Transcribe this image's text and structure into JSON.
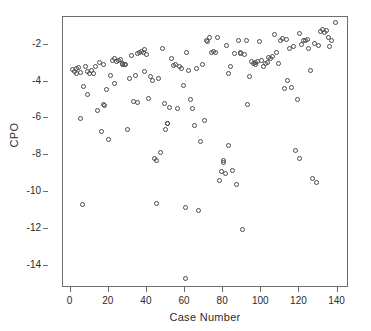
{
  "chart_data": {
    "type": "scatter",
    "title": "",
    "xlabel": "Case Number",
    "ylabel": "CPO",
    "xlim": [
      -4,
      146
    ],
    "ylim": [
      -15.2,
      -0.5
    ],
    "xticks": [
      0,
      20,
      40,
      60,
      80,
      100,
      120,
      140
    ],
    "yticks": [
      -2,
      -4,
      -6,
      -8,
      -10,
      -12,
      -14
    ],
    "xtick_labels": [
      "0",
      "20",
      "40",
      "60",
      "80",
      "100",
      "120",
      "140"
    ],
    "ytick_labels": [
      "-2",
      "-4",
      "-6",
      "-8",
      "-10",
      "-12",
      "-14"
    ],
    "grid": false,
    "legend": null,
    "marker": "open-circle",
    "marker_color": "#4a4a4d",
    "frame_color": "#6e6e70",
    "background": "#ffffff",
    "series": [
      {
        "name": "CPO",
        "points": [
          [
            1,
            -3.35
          ],
          [
            2,
            -3.45
          ],
          [
            3,
            -3.3
          ],
          [
            3,
            -3.55
          ],
          [
            4,
            -3.25
          ],
          [
            5,
            -3.5
          ],
          [
            5,
            -6.0
          ],
          [
            6,
            -10.65
          ],
          [
            7,
            -4.25
          ],
          [
            8,
            -3.2
          ],
          [
            9,
            -3.45
          ],
          [
            9,
            -4.7
          ],
          [
            10,
            -3.55
          ],
          [
            11,
            -3.4
          ],
          [
            12,
            -3.55
          ],
          [
            13,
            -3.2
          ],
          [
            14,
            -5.55
          ],
          [
            15,
            -2.95
          ],
          [
            16,
            -6.7
          ],
          [
            17,
            -3.05
          ],
          [
            17,
            -5.25
          ],
          [
            18,
            -5.3
          ],
          [
            19,
            -4.45
          ],
          [
            20,
            -7.15
          ],
          [
            21,
            -3.65
          ],
          [
            22,
            -2.85
          ],
          [
            23,
            -2.75
          ],
          [
            23,
            -4.1
          ],
          [
            24,
            -2.9
          ],
          [
            25,
            -2.85
          ],
          [
            26,
            -2.8
          ],
          [
            27,
            -3.0
          ],
          [
            27,
            -3.05
          ],
          [
            28,
            -3.1
          ],
          [
            29,
            -3.05
          ],
          [
            30,
            -6.6
          ],
          [
            31,
            -3.85
          ],
          [
            32,
            -2.6
          ],
          [
            33,
            -5.1
          ],
          [
            34,
            -3.65
          ],
          [
            35,
            -2.5
          ],
          [
            35,
            -5.15
          ],
          [
            36,
            -2.45
          ],
          [
            37,
            -2.35
          ],
          [
            38,
            -2.45
          ],
          [
            39,
            -2.25
          ],
          [
            39,
            -3.45
          ],
          [
            40,
            -2.55
          ],
          [
            41,
            -4.9
          ],
          [
            42,
            -3.75
          ],
          [
            43,
            -3.95
          ],
          [
            44,
            -8.15
          ],
          [
            45,
            -8.3
          ],
          [
            45,
            -10.6
          ],
          [
            46,
            -3.85
          ],
          [
            47,
            -7.85
          ],
          [
            48,
            -2.2
          ],
          [
            49,
            -5.2
          ],
          [
            50,
            -6.6
          ],
          [
            51,
            -6.25
          ],
          [
            51,
            -6.3
          ],
          [
            52,
            -5.4
          ],
          [
            53,
            -2.75
          ],
          [
            54,
            -3.15
          ],
          [
            55,
            -3.1
          ],
          [
            56,
            -5.45
          ],
          [
            57,
            -3.2
          ],
          [
            58,
            -3.3
          ],
          [
            59,
            -4.2
          ],
          [
            60,
            -10.85
          ],
          [
            60,
            -14.7
          ],
          [
            61,
            -2.4
          ],
          [
            62,
            -3.4
          ],
          [
            63,
            -5.0
          ],
          [
            64,
            -5.45
          ],
          [
            65,
            -6.4
          ],
          [
            66,
            -3.3
          ],
          [
            67,
            -11.0
          ],
          [
            68,
            -7.25
          ],
          [
            69,
            -3.05
          ],
          [
            70,
            -6.1
          ],
          [
            71,
            -1.8
          ],
          [
            72,
            -1.85
          ],
          [
            73,
            -1.6
          ],
          [
            74,
            -2.4
          ],
          [
            75,
            -2.35
          ],
          [
            76,
            -2.4
          ],
          [
            77,
            -1.6
          ],
          [
            78,
            -9.35
          ],
          [
            79,
            -8.9
          ],
          [
            80,
            -8.3
          ],
          [
            80,
            -8.4
          ],
          [
            81,
            -9.0
          ],
          [
            82,
            -2.05
          ],
          [
            83,
            -3.55
          ],
          [
            83,
            -7.45
          ],
          [
            84,
            -3.2
          ],
          [
            85,
            -8.85
          ],
          [
            86,
            -2.5
          ],
          [
            87,
            -9.6
          ],
          [
            88,
            -1.75
          ],
          [
            89,
            -2.45
          ],
          [
            89,
            -2.5
          ],
          [
            90,
            -12.0
          ],
          [
            91,
            -2.55
          ],
          [
            92,
            -1.8
          ],
          [
            93,
            -5.25
          ],
          [
            94,
            -3.75
          ],
          [
            95,
            -2.9
          ],
          [
            96,
            -3.0
          ],
          [
            97,
            -2.95
          ],
          [
            97,
            -3.1
          ],
          [
            98,
            -2.9
          ],
          [
            99,
            -1.85
          ],
          [
            100,
            -2.85
          ],
          [
            101,
            -3.2
          ],
          [
            102,
            -3.0
          ],
          [
            103,
            -2.95
          ],
          [
            104,
            -2.7
          ],
          [
            105,
            -2.75
          ],
          [
            106,
            -2.65
          ],
          [
            107,
            -1.45
          ],
          [
            108,
            -2.45
          ],
          [
            109,
            -3.0
          ],
          [
            110,
            -1.75
          ],
          [
            111,
            -1.65
          ],
          [
            112,
            -4.4
          ],
          [
            113,
            -1.7
          ],
          [
            114,
            -3.95
          ],
          [
            115,
            -2.2
          ],
          [
            116,
            -4.3
          ],
          [
            117,
            -2.1
          ],
          [
            118,
            -7.75
          ],
          [
            119,
            -5.0
          ],
          [
            120,
            -1.4
          ],
          [
            120,
            -8.15
          ],
          [
            121,
            -2.0
          ],
          [
            122,
            -1.75
          ],
          [
            123,
            -1.8
          ],
          [
            124,
            -1.7
          ],
          [
            125,
            -2.2
          ],
          [
            126,
            -3.4
          ],
          [
            127,
            -9.25
          ],
          [
            128,
            -1.95
          ],
          [
            129,
            -9.5
          ],
          [
            130,
            -2.05
          ],
          [
            131,
            -1.3
          ],
          [
            132,
            -1.2
          ],
          [
            133,
            -1.35
          ],
          [
            134,
            -1.25
          ],
          [
            135,
            -1.6
          ],
          [
            136,
            -2.1
          ],
          [
            137,
            -1.75
          ],
          [
            139,
            -0.8
          ]
        ]
      }
    ]
  }
}
